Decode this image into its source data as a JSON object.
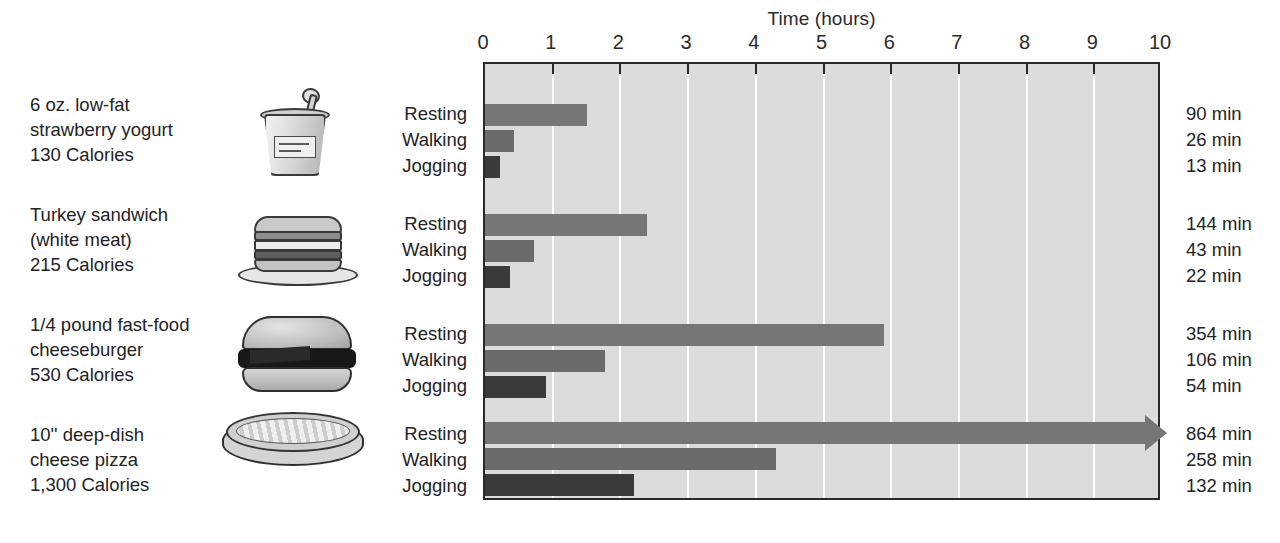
{
  "chart_data": {
    "type": "bar",
    "title": "Time (hours)",
    "xlabel": "Time (hours)",
    "ylabel": "",
    "xlim": [
      0,
      10
    ],
    "xticks": [
      0,
      1,
      2,
      3,
      4,
      5,
      6,
      7,
      8,
      9,
      10
    ],
    "xtick_labels": [
      "0",
      "1",
      "2",
      "3",
      "4",
      "5",
      "6",
      "7",
      "8",
      "9",
      "10"
    ],
    "grid": true,
    "orientation": "horizontal",
    "legend": "none",
    "categories": [
      "Resting",
      "Walking",
      "Jogging"
    ],
    "groups": [
      {
        "food_name": [
          "6 oz. low-fat",
          "strawberry yogurt",
          "130 Calories"
        ],
        "calories": 130,
        "icon": "yogurt-cup-icon",
        "activities": [
          "Resting",
          "Walking",
          "Jogging"
        ],
        "minutes": [
          90,
          26,
          13
        ],
        "minutes_labels": [
          "90 min",
          "26 min",
          "13 min"
        ],
        "hours": [
          1.5,
          0.433,
          0.217
        ],
        "clipped": [
          false,
          false,
          false
        ]
      },
      {
        "food_name": [
          "Turkey sandwich",
          "(white meat)",
          "215 Calories"
        ],
        "calories": 215,
        "icon": "sandwich-icon",
        "activities": [
          "Resting",
          "Walking",
          "Jogging"
        ],
        "minutes": [
          144,
          43,
          22
        ],
        "minutes_labels": [
          "144 min",
          "43 min",
          "22 min"
        ],
        "hours": [
          2.4,
          0.717,
          0.367
        ],
        "clipped": [
          false,
          false,
          false
        ]
      },
      {
        "food_name": [
          "1/4 pound fast-food",
          "cheeseburger",
          "530 Calories"
        ],
        "calories": 530,
        "icon": "cheeseburger-icon",
        "activities": [
          "Resting",
          "Walking",
          "Jogging"
        ],
        "minutes": [
          354,
          106,
          54
        ],
        "minutes_labels": [
          "354 min",
          "106 min",
          "54 min"
        ],
        "hours": [
          5.9,
          1.767,
          0.9
        ],
        "clipped": [
          false,
          false,
          false
        ]
      },
      {
        "food_name": [
          "10'' deep-dish",
          "cheese pizza",
          "1,300 Calories"
        ],
        "calories": 1300,
        "icon": "pizza-icon",
        "activities": [
          "Resting",
          "Walking",
          "Jogging"
        ],
        "minutes": [
          864,
          258,
          132
        ],
        "minutes_labels": [
          "864 min",
          "258 min",
          "132 min"
        ],
        "hours": [
          14.4,
          4.3,
          2.2
        ],
        "clipped": [
          true,
          false,
          false
        ]
      }
    ],
    "colors": {
      "resting": "#767676",
      "walking": "#6b6b6b",
      "jogging": "#3a3a3a",
      "plot_background": "#dcdcdc",
      "gridline": "#ffffff",
      "axis": "#2a2a2a",
      "text": "#232323"
    }
  }
}
